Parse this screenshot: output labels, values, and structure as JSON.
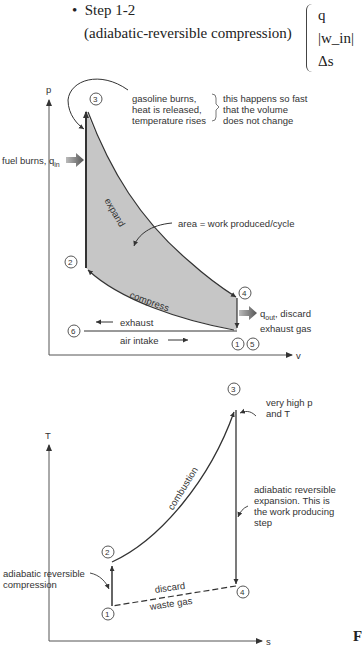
{
  "header": {
    "bullet": "•",
    "step_title": "Step 1-2",
    "step_subtitle": "(adiabatic-reversible compression)",
    "brace_items": [
      "q",
      "|w_in|",
      "Δs"
    ]
  },
  "pv_diagram": {
    "y_axis_label": "p",
    "x_axis_label": "v",
    "points": [
      "1",
      "2",
      "3",
      "4",
      "5",
      "6"
    ],
    "labels": {
      "heat_release": [
        "gasoline burns,",
        "heat is released,",
        "temperature rises"
      ],
      "fast_note": [
        "this happens so fast",
        "that the volume",
        "does not change"
      ],
      "fuel_burns": "fuel burns, q",
      "fuel_burns_sub": "in",
      "expand": "expand",
      "area": "area = work produced/cycle",
      "compress": "compress",
      "qout": "q",
      "qout_sub": "out",
      "qout_rest": ", discard",
      "exhaust_gas": "exhaust gas",
      "exhaust": "exhaust",
      "air_intake": "air intake"
    },
    "fill_color": "#c8c8c8",
    "line_color": "#333333"
  },
  "ts_diagram": {
    "y_axis_label": "T",
    "x_axis_label": "s",
    "points": [
      "1",
      "2",
      "3",
      "4"
    ],
    "labels": {
      "very_high": [
        "very high p",
        "and T"
      ],
      "combustion": "combustion",
      "expansion_note": [
        "adiabatic reversible",
        "expansion. This is",
        "the work producing",
        "step"
      ],
      "compression_note": [
        "adiabatic reversible",
        "compression"
      ],
      "discard": "discard",
      "waste_gas": "waste gas"
    }
  },
  "footer": {
    "figure_letter": "F"
  }
}
